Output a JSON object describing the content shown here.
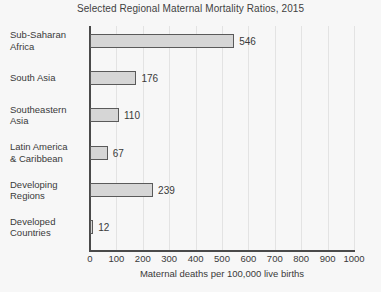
{
  "chart_data": {
    "type": "bar",
    "orientation": "horizontal",
    "title": "Selected Regional Maternal Mortality Ratios, 2015",
    "xlabel": "Maternal deaths per 100,000 live births",
    "ylabel": "",
    "xlim": [
      0,
      1000
    ],
    "xticks": [
      "0",
      "100",
      "200",
      "300",
      "400",
      "500",
      "600",
      "700",
      "800",
      "900",
      "1000"
    ],
    "grid": "vertical",
    "legend": "none",
    "categories": [
      "Sub-Saharan Africa",
      "South Asia",
      "Southeastern Asia",
      "Latin America & Caribbean",
      "Developing Regions",
      "Developed Countries"
    ],
    "values": [
      546,
      176,
      110,
      67,
      239,
      12
    ],
    "bars": [
      {
        "label_line1": "Sub-Saharan",
        "label_line2": "Africa",
        "value": 546,
        "value_label": "546"
      },
      {
        "label_line1": "South Asia",
        "label_line2": "",
        "value": 176,
        "value_label": "176"
      },
      {
        "label_line1": "Southeastern",
        "label_line2": "Asia",
        "value": 110,
        "value_label": "110"
      },
      {
        "label_line1": "Latin America",
        "label_line2": "& Caribbean",
        "value": 67,
        "value_label": "67"
      },
      {
        "label_line1": "Developing",
        "label_line2": "Regions",
        "value": 239,
        "value_label": "239"
      },
      {
        "label_line1": "Developed",
        "label_line2": "Countries",
        "value": 12,
        "value_label": "12"
      }
    ]
  },
  "style": {
    "background": "#f7f7f7",
    "bar_fill": "#d6d6d6",
    "bar_stroke": "#5a5a5a",
    "axis_color": "#4a4a4a",
    "grid_color": "#e3e3e3",
    "text_color": "#3a3a3a"
  }
}
